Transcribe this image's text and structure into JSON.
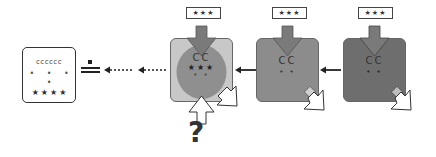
{
  "diagram": {
    "document": {
      "line1": "cccccc",
      "line2": "• • • •",
      "line3": "★★★★"
    },
    "equals_symbol": "=",
    "stages": [
      {
        "id": "stage-1",
        "input_label": "★★★",
        "content_top": "CC",
        "content_mid": "★★★",
        "content_bot": "• •",
        "fill": "#c8c8c8",
        "circle_fill": "#8f8f8f"
      },
      {
        "id": "stage-2",
        "input_label": "★★★",
        "content_top": "CC",
        "content_bot": "• •",
        "fill": "#8c8c8c"
      },
      {
        "id": "stage-3",
        "input_label": "★★★",
        "content_top": "CC",
        "content_bot": "• •",
        "fill": "#6e6e6e"
      }
    ],
    "question_mark": "?",
    "colors": {
      "arrow_in": "#7a7a7a",
      "outline": "#333333",
      "light_box": "#c8c8c8",
      "mid_box": "#8c8c8c",
      "dark_box": "#6e6e6e"
    }
  }
}
